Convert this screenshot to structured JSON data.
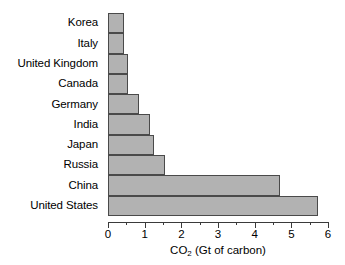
{
  "chart_data": {
    "type": "bar",
    "orientation": "horizontal",
    "title": "",
    "xlabel": "CO2 (Gt of carbon)",
    "xlabel_main": "CO",
    "xlabel_sub": "2",
    "xlabel_rest": " (Gt of carbon)",
    "ylabel": "",
    "categories": [
      "Korea",
      "Italy",
      "United Kingdom",
      "Canada",
      "Germany",
      "India",
      "Japan",
      "Russia",
      "China",
      "United States"
    ],
    "values": [
      0.45,
      0.45,
      0.55,
      0.55,
      0.85,
      1.15,
      1.25,
      1.55,
      4.7,
      5.75
    ],
    "xlim": [
      0,
      6
    ],
    "xticks": [
      0,
      1,
      2,
      3,
      4,
      5,
      6
    ],
    "xtick_labels": [
      "0",
      "1",
      "2",
      "3",
      "4",
      "5",
      "6"
    ],
    "xminor_ticks": [
      0.5,
      1.5,
      2.5,
      3.5,
      4.5,
      5.5
    ],
    "grid": false,
    "legend": null,
    "colors": {
      "bar_fill": "#b2b2b2",
      "bar_edge": "#4a4a4a",
      "axis": "#3a3a3a",
      "text": "#000000",
      "background": "#ffffff"
    }
  }
}
